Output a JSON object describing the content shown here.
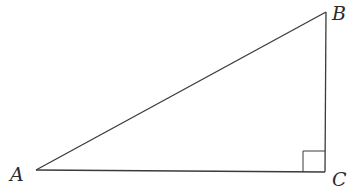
{
  "diagram": {
    "type": "right-triangle",
    "vertices": {
      "A": {
        "label": "A",
        "x": 36,
        "y": 170
      },
      "B": {
        "label": "B",
        "x": 326,
        "y": 12
      },
      "C": {
        "label": "C",
        "x": 325,
        "y": 172
      }
    },
    "right_angle_at": "C",
    "colors": {
      "stroke": "#3a3a3a",
      "background": "#ffffff"
    }
  }
}
